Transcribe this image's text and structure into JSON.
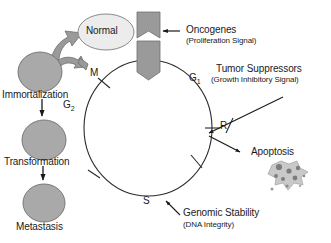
{
  "figure": {
    "background_color": "#ffffff",
    "line_color": "#1a1a1a",
    "cell_fill_color": "#a9a9a9",
    "cell_stroke_color": "#6e6e6e",
    "normal_cell_fill_color": "#ececec",
    "arrow_fill_color": "#9a9a9a",
    "apoptosis_body_color": "#c8c8c8",
    "apoptosis_dot_color": "#808080"
  },
  "cycle": {
    "name": "cell-cycle-circle",
    "phases": [
      {
        "id": "g1",
        "label": "G",
        "sub": "1"
      },
      {
        "id": "g2",
        "label": "G",
        "sub": "2"
      },
      {
        "id": "m",
        "label": "M",
        "sub": ""
      },
      {
        "id": "s",
        "label": "S",
        "sub": ""
      }
    ],
    "restriction_point": "R"
  },
  "annotations": [
    {
      "id": "oncogenes",
      "title": "Oncogenes",
      "subtitle": "(Proliferation Signal)"
    },
    {
      "id": "tumor-suppressors",
      "title": "Tumor Suppressors",
      "subtitle": "(Growth Inhibitory Signal)"
    },
    {
      "id": "genomic-stability",
      "title": "Genomic Stability",
      "subtitle": "(DNA Integrity)"
    },
    {
      "id": "apoptosis",
      "title": "Apoptosis",
      "subtitle": ""
    }
  ],
  "cells": {
    "normal": "Normal",
    "immortalization": "Immortalization",
    "transformation": "Transformation",
    "metastasis": "Metastasis"
  }
}
